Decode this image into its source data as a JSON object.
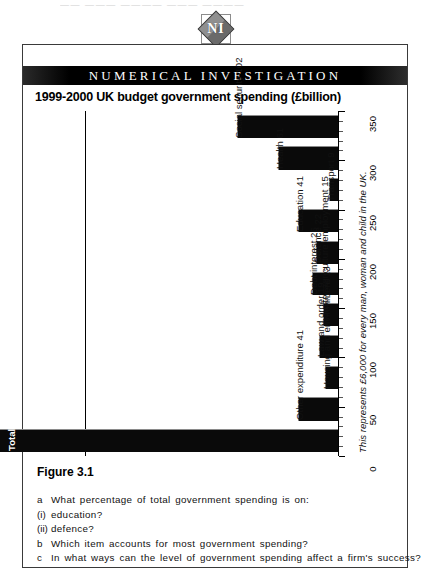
{
  "top_bleed_text": "——  ———  ————  ———  ————",
  "logo": {
    "letter_left": "N",
    "letter_right": "I",
    "name": "NI"
  },
  "banner": {
    "text": "NUMERICAL INVESTIGATION"
  },
  "chart_title": "1999-2000 UK budget government spending (£billion)",
  "figure_label": "Figure 3.1",
  "note": "This represents £6,000 for every man, woman and child in the UK.",
  "chart_data": {
    "type": "bar",
    "title": "1999-2000 UK budget government spending (£billion)",
    "xlabel": "",
    "ylabel": "£billion",
    "ylim": [
      0,
      350
    ],
    "grid": false,
    "legend": "none",
    "orientation": "vertical",
    "tick_labels": [
      "0",
      "50",
      "100",
      "150",
      "200",
      "250",
      "300",
      "350"
    ],
    "tick_values": [
      0,
      50,
      100,
      150,
      200,
      250,
      300,
      350
    ],
    "categories": [
      "Social security",
      "Health",
      "Transport",
      "Education",
      "Defence",
      "Debt interest",
      "Industry agriculture employment",
      "Law and order",
      "Housing and environment",
      "Other expenditure",
      "Total"
    ],
    "values": [
      102,
      61,
      9,
      41,
      22,
      26,
      15,
      19,
      13,
      41,
      349
    ],
    "bar_labels": [
      "Social security 102",
      "Health 61",
      "Transport 9",
      "Education 41",
      "Defence 22",
      "Debt interest 26",
      "Industry agriculture employment 15",
      "Law and order 19",
      "Housing and environment 13",
      "Other expenditure 41",
      "Total 349"
    ],
    "annotations": [
      "This represents £6,000 for every man, woman and child in the UK."
    ]
  },
  "questions": [
    {
      "mark": "a",
      "text": "What percentage of total government spending is on:"
    },
    {
      "mark": "(i)",
      "text": "education?"
    },
    {
      "mark": "(ii)",
      "text": "defence?"
    },
    {
      "mark": "b",
      "text": "Which item accounts for most government spending?"
    },
    {
      "mark": "c",
      "text": "In what ways can the level of government spending affect a firm's success?"
    }
  ],
  "colors": {
    "bar": "#0a0a0a",
    "banner_bg": "#000000",
    "banner_text": "#ffffff",
    "frame": "#3a3a3a",
    "page_bg": "#ffffff"
  }
}
